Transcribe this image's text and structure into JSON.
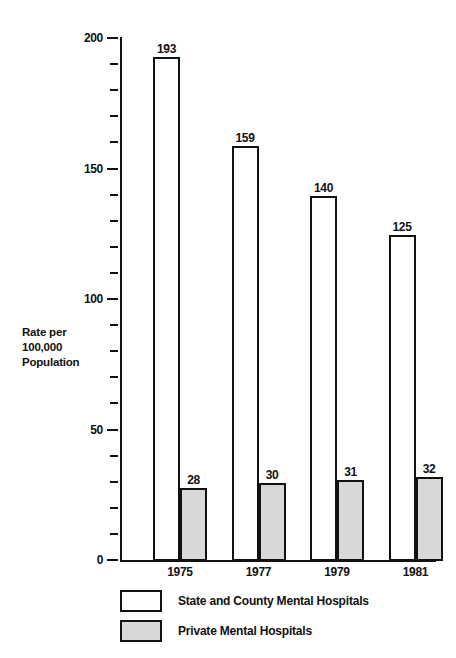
{
  "chart_data": {
    "type": "bar",
    "title": "",
    "xlabel": "",
    "ylabel": "Rate per\n100,000\nPopulation",
    "ylabel_lines": [
      "Rate per",
      "100,000",
      "Population"
    ],
    "categories": [
      "1975",
      "1977",
      "1979",
      "1981"
    ],
    "series": [
      {
        "name": "State and County Mental Hospitals",
        "values": [
          193,
          159,
          140,
          125
        ],
        "fill": "#ffffff",
        "stroke": "#111111"
      },
      {
        "name": "Private Mental Hospitals",
        "values": [
          28,
          30,
          31,
          32
        ],
        "fill": "#d8d8d8",
        "stroke": "#111111"
      }
    ],
    "ylim": [
      0,
      200
    ],
    "y_major_ticks": [
      0,
      50,
      100,
      150,
      200
    ],
    "y_major_tick_labels": [
      "0",
      "50",
      "100",
      "150",
      "200"
    ],
    "y_minor_tick_step": 10,
    "grid": false,
    "legend_position": "bottom-left",
    "legend": [
      {
        "label": "State and County Mental Hospitals",
        "swatch": "white"
      },
      {
        "label": "Private Mental Hospitals",
        "swatch": "gray"
      }
    ]
  }
}
